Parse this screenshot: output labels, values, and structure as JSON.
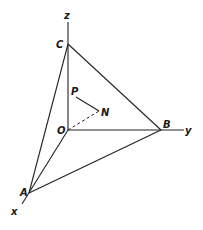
{
  "diagram": {
    "type": "3d-coordinate-tetrahedron",
    "axes": {
      "x": {
        "label": "x"
      },
      "y": {
        "label": "y"
      },
      "z": {
        "label": "z"
      }
    },
    "points": {
      "O": {
        "label": "O"
      },
      "A": {
        "label": "A"
      },
      "B": {
        "label": "B"
      },
      "C": {
        "label": "C"
      },
      "P": {
        "label": "P"
      },
      "N": {
        "label": "N"
      }
    },
    "edges": [
      "AB",
      "BC",
      "CA",
      "OA",
      "OB",
      "OC",
      "PN"
    ],
    "dashed_edges": [
      "ON"
    ]
  }
}
